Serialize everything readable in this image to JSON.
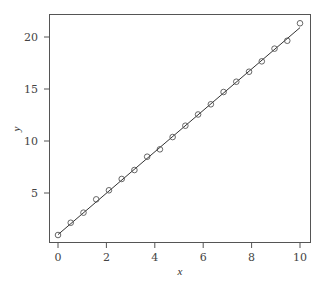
{
  "chart_data": {
    "type": "scatter",
    "title": "",
    "xlabel": "x",
    "ylabel": "y",
    "xlim": [
      -0.5,
      10.4
    ],
    "ylim": [
      0.3,
      22.1
    ],
    "grid": false,
    "legend": null,
    "x_ticks": [
      0,
      2,
      4,
      6,
      8,
      10
    ],
    "y_ticks": [
      5,
      10,
      15,
      20
    ],
    "series": [
      {
        "name": "observations",
        "marker": "open-circle",
        "x": [
          0,
          0.526,
          1.053,
          1.579,
          2.105,
          2.632,
          3.158,
          3.684,
          4.211,
          4.737,
          5.263,
          5.789,
          6.316,
          6.842,
          7.368,
          7.895,
          8.421,
          8.947,
          9.474,
          10
        ],
        "y": [
          0.96,
          2.14,
          3.11,
          4.39,
          5.26,
          6.35,
          7.21,
          8.49,
          9.2,
          10.38,
          11.47,
          12.55,
          13.53,
          14.71,
          15.7,
          16.66,
          17.66,
          18.88,
          19.64,
          21.32
        ]
      },
      {
        "name": "fitted line",
        "type": "line",
        "x": [
          0,
          10
        ],
        "y": [
          1.0,
          20.9
        ]
      }
    ]
  },
  "style": {
    "axis_color": "#555555",
    "line_color": "#333333",
    "marker_color": "#555555"
  }
}
